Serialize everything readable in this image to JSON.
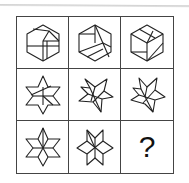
{
  "puzzle": {
    "rows": 3,
    "cols": 3,
    "cells": [
      {
        "row": 1,
        "col": 1,
        "figure": "hexagon-dissected-a",
        "icon": "hexagon-figure-icon"
      },
      {
        "row": 1,
        "col": 2,
        "figure": "hexagon-dissected-b",
        "icon": "hexagon-figure-icon"
      },
      {
        "row": 1,
        "col": 3,
        "figure": "hexagon-dissected-c",
        "icon": "hexagon-figure-icon"
      },
      {
        "row": 2,
        "col": 1,
        "figure": "star-dissected-a",
        "icon": "six-point-star-figure-icon"
      },
      {
        "row": 2,
        "col": 2,
        "figure": "star-dissected-b",
        "icon": "six-point-star-figure-icon"
      },
      {
        "row": 2,
        "col": 3,
        "figure": "star-dissected-c",
        "icon": "six-point-star-figure-icon"
      },
      {
        "row": 3,
        "col": 1,
        "figure": "star-rhombus-a",
        "icon": "six-point-star-figure-icon"
      },
      {
        "row": 3,
        "col": 2,
        "figure": "star-rhombus-b",
        "icon": "six-point-star-figure-icon"
      },
      {
        "row": 3,
        "col": 3,
        "figure": "missing",
        "icon": "question-mark-icon"
      }
    ],
    "missing_label": "?"
  }
}
